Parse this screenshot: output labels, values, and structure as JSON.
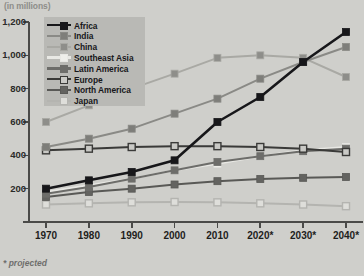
{
  "unit_label": "(in millions)",
  "footnote": "* projected",
  "legend": {
    "entries": [
      {
        "label": "Africa",
        "color": "#17171a",
        "marker": "filled",
        "marker_fill": "#17171a"
      },
      {
        "label": "India",
        "color": "#8a8a86",
        "marker": "filled",
        "marker_fill": "#7e7e7a"
      },
      {
        "label": "China",
        "color": "#a9a9a4",
        "marker": "filled",
        "marker_fill": "#8e8e8a"
      },
      {
        "label": "Southeast Asia",
        "color": "#e8e8e4",
        "marker": "filled",
        "marker_fill": "#eeeeea"
      },
      {
        "label": "Latin America",
        "color": "#6d6d6a",
        "marker": "filled",
        "marker_fill": "#6d6d6a"
      },
      {
        "label": "Europe",
        "color": "#3a3a38",
        "marker": "open",
        "marker_fill": "#c9c9c5"
      },
      {
        "label": "North America",
        "color": "#595956",
        "marker": "filled",
        "marker_fill": "#636360"
      },
      {
        "label": "Japan",
        "color": "#b4b4b0",
        "marker": "open",
        "marker_fill": "#dededa"
      }
    ]
  },
  "chart_data": {
    "type": "line",
    "title": "",
    "subtitle": "",
    "xlabel": "",
    "ylabel": "(in millions)",
    "x": [
      "1970",
      "1980",
      "1990",
      "2000",
      "2010",
      "2020*",
      "2030*",
      "2040*"
    ],
    "xtick_labels": [
      "1970",
      "1980",
      "1990",
      "2000",
      "2010",
      "2020*",
      "2030*",
      "2040*"
    ],
    "ytick_labels": [
      "0",
      "200",
      "400",
      "600",
      "800",
      "1,000",
      "1,200"
    ],
    "ytick_values": [
      0,
      200,
      400,
      600,
      800,
      1000,
      1200
    ],
    "ylim": [
      0,
      1200
    ],
    "grid": false,
    "legend_position": "top-left-inside",
    "annotations": [
      "* projected"
    ],
    "series": [
      {
        "name": "Africa",
        "color": "#17171a",
        "marker": "filled",
        "marker_fill": "#17171a",
        "values": [
          200,
          250,
          300,
          370,
          600,
          750,
          960,
          1140
        ]
      },
      {
        "name": "India",
        "color": "#8a8a86",
        "marker": "filled",
        "marker_fill": "#7e7e7a",
        "values": [
          450,
          500,
          560,
          650,
          740,
          860,
          960,
          1050
        ]
      },
      {
        "name": "China",
        "color": "#a9a9a4",
        "marker": "filled",
        "marker_fill": "#8e8e8a",
        "values": [
          600,
          700,
          800,
          890,
          985,
          1000,
          985,
          870
        ]
      },
      {
        "name": "Southeast Asia",
        "color": "#e8e8e4",
        "marker": "filled",
        "marker_fill": "#eeeeea",
        "values": [
          180,
          220,
          260,
          310,
          350,
          395,
          430,
          450
        ]
      },
      {
        "name": "Latin America",
        "color": "#6d6d6a",
        "marker": "filled",
        "marker_fill": "#6d6d6a",
        "values": [
          170,
          210,
          260,
          310,
          360,
          395,
          425,
          440
        ]
      },
      {
        "name": "Europe",
        "color": "#3a3a38",
        "marker": "open",
        "marker_fill": "#c9c9c5",
        "values": [
          430,
          440,
          450,
          455,
          455,
          450,
          440,
          420
        ]
      },
      {
        "name": "North America",
        "color": "#595956",
        "marker": "filled",
        "marker_fill": "#636360",
        "values": [
          150,
          180,
          200,
          225,
          245,
          258,
          265,
          270
        ]
      },
      {
        "name": "Japan",
        "color": "#b4b4b0",
        "marker": "open",
        "marker_fill": "#dededa",
        "values": [
          105,
          112,
          118,
          120,
          118,
          112,
          105,
          95
        ]
      }
    ]
  }
}
